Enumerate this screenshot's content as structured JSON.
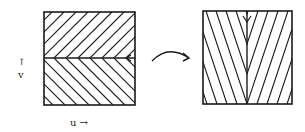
{
  "diagram": {
    "labels": {
      "v_arrow": "↑",
      "v": "v",
      "u": "u →"
    },
    "left_square": {
      "x": 44,
      "y": 12,
      "w": 91,
      "h": 93,
      "split_y": 58,
      "top_hatch": "diagonal-up-right",
      "bottom_hatch": "diagonal-down-right"
    },
    "right_square": {
      "x": 203,
      "y": 11,
      "w": 89,
      "h": 93,
      "split_x": 247,
      "left_hatch": "diagonal-down-right",
      "right_hatch": "diagonal-down-left"
    },
    "transform_arrow": "curved-arrow-right",
    "colors": {
      "ink": "#1a1a1a",
      "background": "#ffffff"
    }
  }
}
